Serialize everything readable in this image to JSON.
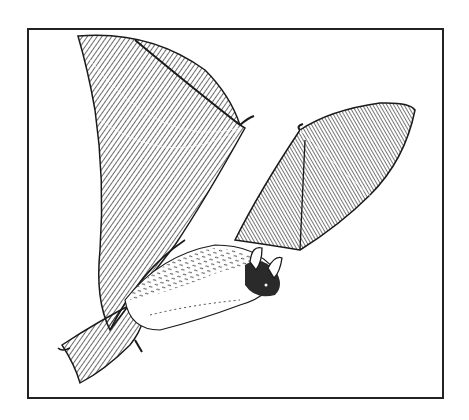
{
  "illustration": {
    "subject": "bat-in-flight",
    "style": "black ink hatched line drawing",
    "colors": {
      "ink": "#1a1a1a",
      "paper": "#ffffff",
      "frame": "#222222"
    }
  }
}
